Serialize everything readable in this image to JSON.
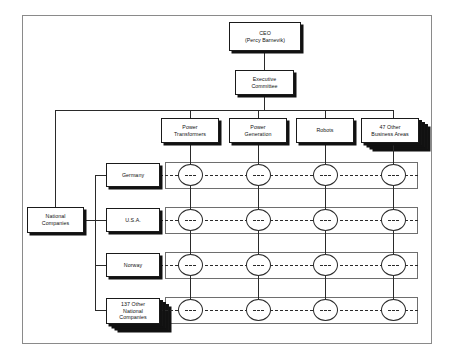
{
  "diagram": {
    "type": "matrix-organization-chart",
    "title_text": "",
    "background": "#ffffff",
    "frame_color": "#8a8a8a",
    "box_border_color": "#1a1a1a",
    "shadow_color": "#111111",
    "line_color": "#2a2a2a"
  },
  "top": {
    "ceo": {
      "line1": "CEO",
      "line2": "(Percy Barnevik)"
    },
    "executive_committee": "Executive\nCommittee"
  },
  "business_areas": [
    {
      "label": "Power\nTransformers",
      "stacked": false,
      "stack_count": 0
    },
    {
      "label": "Power\nGeneration",
      "stacked": false,
      "stack_count": 0
    },
    {
      "label": "Robots",
      "stacked": false,
      "stack_count": 0
    },
    {
      "label": "47 Other\nBusiness Areas",
      "stacked": true,
      "stack_count": 3
    }
  ],
  "national": {
    "root_label": "National\nCompanies",
    "companies": [
      {
        "label": "Germany",
        "stacked": false,
        "stack_count": 0
      },
      {
        "label": "U.S.A.",
        "stacked": false,
        "stack_count": 0
      },
      {
        "label": "Norway",
        "stacked": false,
        "stack_count": 0
      },
      {
        "label": "137 Other\nNational\nCompanies",
        "stacked": true,
        "stack_count": 3
      }
    ]
  },
  "matrix": {
    "rows": 4,
    "columns": 4,
    "node_symbol": "- - -",
    "row_link_style": "dashed",
    "column_link_style": "solid"
  }
}
